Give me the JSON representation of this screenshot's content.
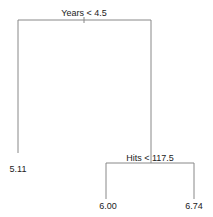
{
  "tree": {
    "root": {
      "split": "Years < 4.5"
    },
    "internal": {
      "split": "Hits < 117.5"
    },
    "leaves": [
      "5.11",
      "6.00",
      "6.74"
    ]
  },
  "colors": {
    "edge": "#888888",
    "text": "#222222",
    "background": "#ffffff"
  }
}
